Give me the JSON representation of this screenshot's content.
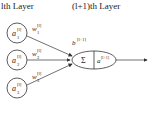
{
  "headers": {
    "left": "lth Layer",
    "right": "(l+1)th Layer"
  },
  "inputs": [
    {
      "node": "a",
      "sub": "1",
      "sup": "[l]",
      "weight": "w",
      "weight_sub": "1",
      "weight_sup": "[l]"
    },
    {
      "node": "a",
      "sub": "2",
      "sup": "[l]",
      "weight": "w",
      "weight_sub": "2",
      "weight_sup": "[l]"
    },
    {
      "node": "a",
      "sub": "3",
      "sup": "[l]",
      "weight": "w",
      "weight_sub": "3",
      "weight_sup": "[l]"
    }
  ],
  "neuron": {
    "sum_symbol": "Σ",
    "activation": "a",
    "activation_sup": "[l+1]",
    "bias": "b",
    "bias_sup": "[l+1]"
  },
  "colors": {
    "stroke": "#333333",
    "text": "#222222",
    "background": "#ffffff"
  }
}
